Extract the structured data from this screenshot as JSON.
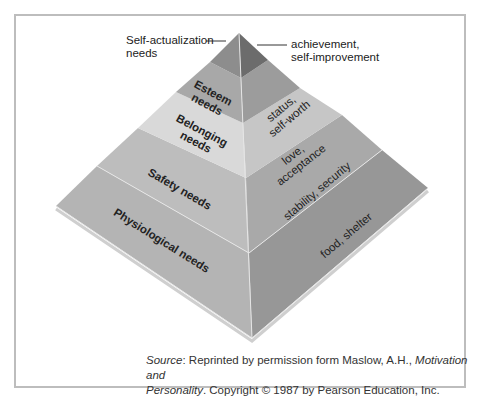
{
  "figure": {
    "tiers": [
      {
        "left_label": "Self-actualization needs",
        "right_label": "achievement, self-improvement",
        "left_color": "#8e8e8e",
        "right_color": "#6e6e6e"
      },
      {
        "left_label": "Esteem needs",
        "right_label": "status, self-worth",
        "left_color": "#a9a9a9",
        "right_color": "#9b9b9b"
      },
      {
        "left_label": "Belonging needs",
        "right_label": "love, acceptance",
        "left_color": "#d8d8d8",
        "right_color": "#c4c4c4"
      },
      {
        "left_label": "Safety needs",
        "right_label": "stability, security",
        "left_color": "#bdbdbd",
        "right_color": "#a8a8a8"
      },
      {
        "left_label": "Physiological needs",
        "right_label": "food, shelter",
        "left_color": "#b3b3b3",
        "right_color": "#959595"
      }
    ],
    "callouts": {
      "self_actualization_line1": "Self-actualization",
      "self_actualization_line2": "needs",
      "achievement_line1": "achievement,",
      "achievement_line2": "self-improvement"
    },
    "labels": {
      "esteem_1": "Esteem",
      "esteem_2": "needs",
      "status_1": "status,",
      "status_2": "self-worth",
      "belonging_1": "Belonging",
      "belonging_2": "needs",
      "love_1": "love,",
      "love_2": "acceptance",
      "safety": "Safety needs",
      "stability": "stability, security",
      "physiological": "Physiological needs",
      "food": "food, shelter"
    }
  },
  "source": {
    "prefix": "Source",
    "text1": ": Reprinted by permission form Maslow, A.H., ",
    "title1": "Motivation and",
    "title2": "Personality",
    "text2": ". Copyright © 1987 by Pearson Education, Inc."
  }
}
